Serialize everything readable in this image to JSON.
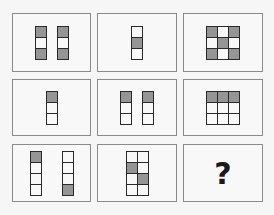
{
  "puzzle": {
    "title": "",
    "colors": {
      "filled": "#959595",
      "empty": "#f8f8f8",
      "border": "#2a2a2a",
      "frame": "#8a8a8a"
    },
    "rows": [
      [
        {
          "shapes": [
            {
              "cols": 1,
              "rows": 3,
              "cells": [
                1,
                0,
                1
              ]
            },
            {
              "cols": 1,
              "rows": 3,
              "cells": [
                1,
                0,
                1
              ]
            }
          ]
        },
        {
          "shapes": [
            {
              "cols": 1,
              "rows": 3,
              "cells": [
                0,
                1,
                0
              ]
            }
          ]
        },
        {
          "shapes": [
            {
              "cols": 3,
              "rows": 3,
              "cells": [
                1,
                0,
                1,
                0,
                1,
                0,
                1,
                0,
                1
              ]
            }
          ]
        }
      ],
      [
        {
          "shapes": [
            {
              "cols": 1,
              "rows": 3,
              "cells": [
                1,
                0,
                0
              ]
            }
          ]
        },
        {
          "shapes": [
            {
              "cols": 1,
              "rows": 3,
              "cells": [
                1,
                0,
                0
              ]
            },
            {
              "cols": 1,
              "rows": 3,
              "cells": [
                1,
                0,
                0
              ]
            }
          ]
        },
        {
          "shapes": [
            {
              "cols": 3,
              "rows": 3,
              "cells": [
                1,
                1,
                1,
                0,
                0,
                0,
                0,
                0,
                0
              ]
            }
          ]
        }
      ],
      [
        {
          "shapes": [
            {
              "cols": 1,
              "rows": 4,
              "cells": [
                1,
                0,
                0,
                0
              ]
            },
            {
              "cols": 1,
              "rows": 4,
              "cells": [
                0,
                0,
                0,
                1
              ]
            }
          ]
        },
        {
          "shapes": [
            {
              "cols": 2,
              "rows": 4,
              "cells": [
                0,
                0,
                1,
                0,
                0,
                1,
                0,
                0
              ]
            }
          ]
        },
        {
          "question": "?"
        }
      ]
    ]
  }
}
